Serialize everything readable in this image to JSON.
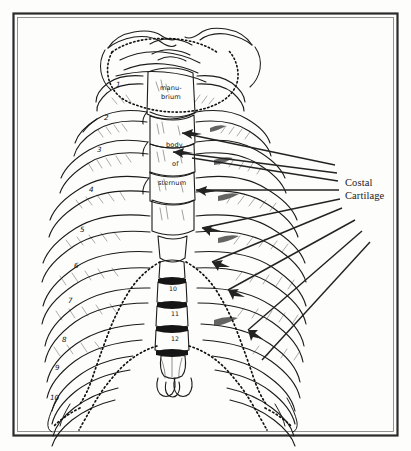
{
  "figure": {
    "background_color": "#fdfdfc",
    "ink_color": "#1b1b1b",
    "border": {
      "outer_color": "#2b2b2b",
      "inner_color": "#555555",
      "x": 13,
      "y": 13,
      "width": 385,
      "height": 423
    }
  },
  "callout": {
    "label_line1": "Costal",
    "label_line2": "Cartilage",
    "label_x": 345,
    "label_y": 188,
    "leader_count": 8
  },
  "sternum_labels": [
    {
      "id": "manubrium-upper",
      "text": "manu-",
      "x": 160,
      "y": 90
    },
    {
      "id": "manubrium-lower",
      "text": "brium",
      "x": 161,
      "y": 99
    },
    {
      "id": "body-word",
      "text": "body",
      "x": 166,
      "y": 147
    },
    {
      "id": "of-word",
      "text": "of",
      "x": 172,
      "y": 166
    },
    {
      "id": "sternum-word",
      "text": "sternum",
      "x": 160,
      "y": 185
    }
  ],
  "rib_numbers": [
    {
      "num": "1",
      "x": 116,
      "y": 87
    },
    {
      "num": "2",
      "x": 104,
      "y": 120
    },
    {
      "num": "3",
      "x": 97,
      "y": 152
    },
    {
      "num": "4",
      "x": 89,
      "y": 192
    },
    {
      "num": "5",
      "x": 80,
      "y": 232
    },
    {
      "num": "6",
      "x": 74,
      "y": 268
    },
    {
      "num": "7",
      "x": 68,
      "y": 303
    },
    {
      "num": "8",
      "x": 62,
      "y": 342
    },
    {
      "num": "9",
      "x": 55,
      "y": 370
    },
    {
      "num": "10",
      "x": 52,
      "y": 400
    }
  ],
  "vertebra_numbers": [
    {
      "num": "10",
      "x": 170,
      "y": 290
    },
    {
      "num": "11",
      "x": 172,
      "y": 315
    },
    {
      "num": "12",
      "x": 172,
      "y": 340
    }
  ],
  "colors": {
    "ink": "#1b1b1b",
    "leader": "#2a2a2a",
    "shade": "#4a4a4a",
    "paper": "#fdfdfc"
  }
}
